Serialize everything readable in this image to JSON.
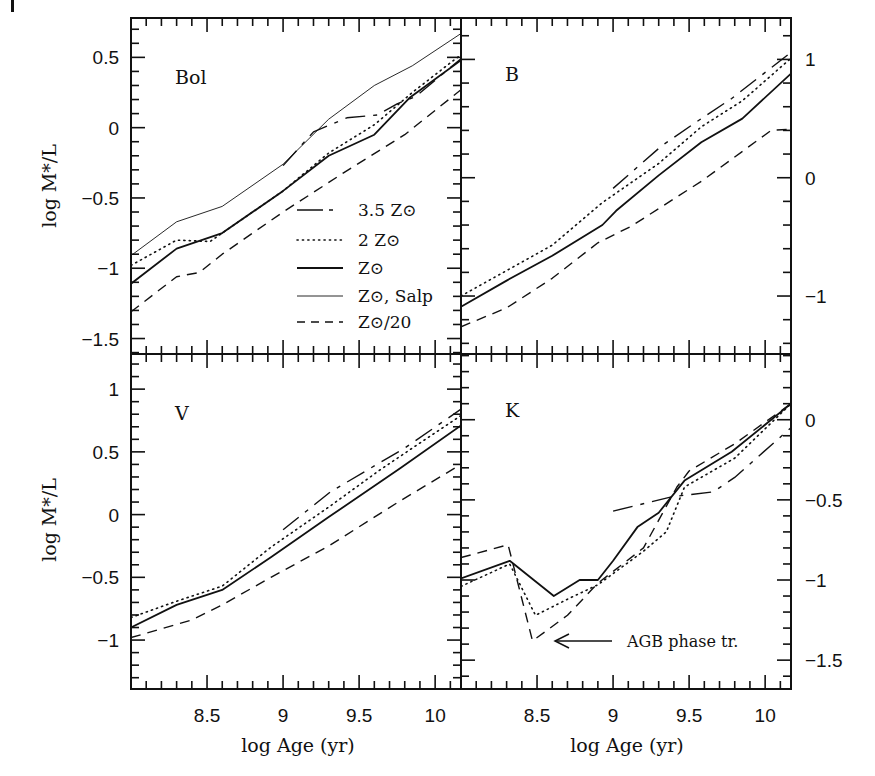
{
  "figure": {
    "artifact_mark": true,
    "xlabel": "log Age (yr)",
    "ylabel": "log M*/L",
    "x_ticks": [
      "8.5",
      "9",
      "9.5",
      "10"
    ]
  },
  "legend": {
    "items": [
      {
        "label": "3.5 Z⊙",
        "style": "longdash"
      },
      {
        "label": "2 Z⊙",
        "style": "dotted"
      },
      {
        "label": "Z⊙",
        "style": "solid"
      },
      {
        "label": "Z⊙, Salp",
        "style": "thin"
      },
      {
        "label": "Z⊙/20",
        "style": "dashed"
      }
    ]
  },
  "annotation": {
    "text": "AGB phase tr.",
    "panel": "K"
  },
  "chart_data": [
    {
      "type": "line",
      "panel": "Bol",
      "title": "Bol",
      "xlabel": "",
      "ylabel": "log M*/L",
      "xlim": [
        8.0,
        10.17
      ],
      "ylim": [
        -1.61,
        0.78
      ],
      "y_ticks": [
        -1.5,
        -1,
        -0.5,
        0,
        0.5
      ],
      "y_tick_labels": [
        "−1.5",
        "−1",
        "−0.5",
        "0",
        "0.5"
      ],
      "y_axis_side": "left",
      "grid": false,
      "legend_position": "lower right",
      "series": [
        {
          "name": "3.5 Z⊙",
          "style": "longdash",
          "x": [
            9.0,
            9.2,
            9.42,
            9.62,
            9.75,
            9.87,
            10.17
          ],
          "y": [
            -0.27,
            -0.03,
            0.07,
            0.09,
            0.17,
            0.22,
            0.49
          ]
        },
        {
          "name": "2 Z⊙",
          "style": "dotted",
          "x": [
            8.0,
            8.3,
            8.52,
            8.6,
            9.0,
            9.3,
            9.6,
            9.85,
            10.17
          ],
          "y": [
            -0.98,
            -0.8,
            -0.81,
            -0.75,
            -0.45,
            -0.18,
            0.02,
            0.25,
            0.52
          ]
        },
        {
          "name": "Z⊙",
          "style": "solid",
          "x": [
            8.0,
            8.3,
            8.6,
            9.0,
            9.3,
            9.6,
            9.83,
            10.17
          ],
          "y": [
            -1.11,
            -0.86,
            -0.75,
            -0.45,
            -0.2,
            -0.05,
            0.21,
            0.48
          ]
        },
        {
          "name": "Z⊙, Salp",
          "style": "thin",
          "x": [
            8.0,
            8.3,
            8.6,
            9.0,
            9.3,
            9.6,
            9.85,
            10.17
          ],
          "y": [
            -0.91,
            -0.67,
            -0.56,
            -0.26,
            0.06,
            0.3,
            0.44,
            0.67
          ]
        },
        {
          "name": "Z⊙/20",
          "style": "dashed",
          "x": [
            8.0,
            8.3,
            8.45,
            8.6,
            9.0,
            9.4,
            9.8,
            10.17
          ],
          "y": [
            -1.31,
            -1.06,
            -1.03,
            -0.9,
            -0.6,
            -0.32,
            -0.05,
            0.27
          ]
        }
      ]
    },
    {
      "type": "line",
      "panel": "B",
      "title": "B",
      "xlim": [
        8.0,
        10.17
      ],
      "ylim": [
        -1.49,
        1.35
      ],
      "y_ticks": [
        -1,
        0,
        1
      ],
      "y_tick_labels": [
        "−1",
        "0",
        "1"
      ],
      "y_axis_side": "right",
      "grid": false,
      "series": [
        {
          "name": "3.5 Z⊙",
          "style": "longdash",
          "x": [
            9.0,
            9.32,
            9.58,
            9.78,
            10.17
          ],
          "y": [
            -0.09,
            0.27,
            0.5,
            0.67,
            1.06
          ]
        },
        {
          "name": "2 Z⊙",
          "style": "dotted",
          "x": [
            8.0,
            8.6,
            8.93,
            9.3,
            9.58,
            9.85,
            10.17
          ],
          "y": [
            -1.0,
            -0.57,
            -0.21,
            0.12,
            0.43,
            0.65,
            1.01
          ]
        },
        {
          "name": "Z⊙",
          "style": "solid",
          "x": [
            8.0,
            8.3,
            8.6,
            8.93,
            9.02,
            9.3,
            9.58,
            9.85,
            10.17
          ],
          "y": [
            -1.09,
            -0.87,
            -0.66,
            -0.4,
            -0.28,
            0.02,
            0.3,
            0.5,
            0.88
          ]
        },
        {
          "name": "Z⊙/20",
          "style": "dashed",
          "x": [
            8.0,
            8.3,
            8.6,
            8.9,
            9.12,
            9.58,
            10.04,
            10.17
          ],
          "y": [
            -1.26,
            -1.1,
            -0.85,
            -0.55,
            -0.41,
            -0.03,
            0.4,
            0.41
          ]
        }
      ]
    },
    {
      "type": "line",
      "panel": "V",
      "title": "V",
      "xlabel": "log Age (yr)",
      "ylabel": "log M*/L",
      "xlim": [
        8.0,
        10.17
      ],
      "ylim": [
        -1.39,
        1.28
      ],
      "y_ticks": [
        -1,
        -0.5,
        0,
        0.5,
        1
      ],
      "y_tick_labels": [
        "−1",
        "−0.5",
        "0",
        "0.5",
        "1"
      ],
      "y_axis_side": "left",
      "grid": false,
      "series": [
        {
          "name": "3.5 Z⊙",
          "style": "longdash",
          "x": [
            9.0,
            9.31,
            9.63,
            9.8,
            10.17
          ],
          "y": [
            -0.12,
            0.18,
            0.41,
            0.53,
            0.84
          ]
        },
        {
          "name": "2 Z⊙",
          "style": "dotted",
          "x": [
            8.0,
            8.3,
            8.6,
            8.92,
            9.3,
            9.63,
            9.85,
            10.17
          ],
          "y": [
            -0.82,
            -0.69,
            -0.57,
            -0.26,
            0.06,
            0.35,
            0.53,
            0.79
          ]
        },
        {
          "name": "Z⊙",
          "style": "solid",
          "x": [
            8.0,
            8.3,
            8.6,
            8.92,
            9.3,
            9.77,
            10.17
          ],
          "y": [
            -0.9,
            -0.72,
            -0.6,
            -0.34,
            -0.02,
            0.37,
            0.71
          ]
        },
        {
          "name": "Z⊙/20",
          "style": "dashed",
          "x": [
            8.0,
            8.4,
            8.6,
            8.92,
            9.3,
            9.77,
            10.17
          ],
          "y": [
            -0.98,
            -0.84,
            -0.72,
            -0.5,
            -0.25,
            0.11,
            0.4
          ]
        }
      ]
    },
    {
      "type": "line",
      "panel": "K",
      "title": "K",
      "xlabel": "log Age (yr)",
      "xlim": [
        8.0,
        10.17
      ],
      "ylim": [
        -1.68,
        0.41
      ],
      "y_ticks": [
        -1.5,
        -1,
        -0.5,
        0
      ],
      "y_tick_labels": [
        "−1.5",
        "−1",
        "−0.5",
        "0"
      ],
      "y_axis_side": "right",
      "grid": false,
      "annotations": [
        {
          "text": "AGB phase tr.",
          "arrow_to": [
            8.6,
            -1.4
          ]
        }
      ],
      "series": [
        {
          "name": "3.5 Z⊙",
          "style": "longdash",
          "x": [
            9.0,
            9.39,
            9.66,
            9.8,
            10.17
          ],
          "y": [
            -0.57,
            -0.48,
            -0.45,
            -0.36,
            -0.05
          ]
        },
        {
          "name": "2 Z⊙",
          "style": "dotted",
          "x": [
            8.0,
            8.32,
            8.49,
            8.7,
            8.9,
            9.2,
            9.35,
            9.47,
            9.8,
            10.17
          ],
          "y": [
            -1.04,
            -0.9,
            -1.22,
            -1.12,
            -1.03,
            -0.82,
            -0.7,
            -0.42,
            -0.24,
            0.1
          ]
        },
        {
          "name": "Z⊙",
          "style": "solid",
          "x": [
            8.0,
            8.32,
            8.61,
            8.78,
            8.9,
            9.0,
            9.16,
            9.3,
            9.47,
            9.78,
            10.17
          ],
          "y": [
            -0.99,
            -0.88,
            -1.1,
            -1.0,
            -1.0,
            -0.88,
            -0.67,
            -0.58,
            -0.38,
            -0.2,
            0.1
          ]
        },
        {
          "name": "Z⊙/20",
          "style": "dashed",
          "x": [
            8.0,
            8.31,
            8.47,
            8.7,
            8.9,
            9.2,
            9.42,
            9.5,
            9.8,
            10.17
          ],
          "y": [
            -0.86,
            -0.78,
            -1.38,
            -1.22,
            -1.02,
            -0.8,
            -0.42,
            -0.32,
            -0.15,
            0.1
          ]
        }
      ]
    }
  ]
}
